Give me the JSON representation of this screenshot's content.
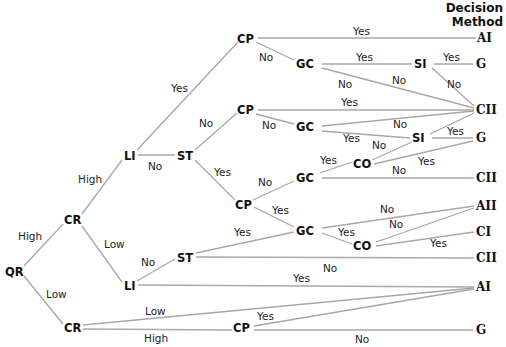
{
  "header": {
    "line1": "Decision",
    "line2": "Method"
  },
  "nodes": {
    "qr": "QR",
    "cr_high": "CR",
    "cr_low": "CR",
    "li_top": "LI",
    "li_bottom": "LI",
    "st_top": "ST",
    "st_bottom": "ST",
    "cp1": "CP",
    "cp2": "CP",
    "cp3": "CP",
    "cp4": "CP",
    "gc1": "GC",
    "gc2": "GC",
    "gc3": "GC",
    "gc4": "GC",
    "si1": "SI",
    "si2": "SI",
    "co1": "CO",
    "co2": "CO"
  },
  "outcomes": [
    "AI",
    "G",
    "CII",
    "G",
    "CII",
    "AII",
    "CI",
    "CII",
    "AI",
    "G"
  ],
  "labels": {
    "qr_high": "High",
    "qr_low": "Low",
    "cr_high": "High",
    "cr_low": "Low",
    "li_yes": "Yes",
    "li_no": "No",
    "st_no": "No",
    "st_yes": "Yes",
    "cp1_yes": "Yes",
    "cp1_no": "No",
    "gc1_yes": "Yes",
    "gc1_no_a": "No",
    "gc1_no_b": "No",
    "si1_yes": "Yes",
    "si1_no": "No",
    "cp2_yes": "Yes",
    "cp2_no": "No",
    "gc2_no": "No",
    "gc2_yes": "Yes",
    "si2_yes": "Yes",
    "si2_no": "No",
    "cp3_no": "No",
    "cp3_yes": "Yes",
    "gc3_yes": "Yes",
    "gc3_no": "No",
    "co1_yes": "Yes",
    "gc4_no": "No",
    "gc4_yes": "Yes",
    "co2_no": "No",
    "co2_yes": "Yes",
    "st2_yes": "Yes",
    "st2_no": "No",
    "li2_no": "No",
    "li2_yes": "Yes",
    "cr2_low": "Low",
    "cr2_high": "High",
    "cp4_yes": "Yes",
    "cp4_no": "No"
  }
}
